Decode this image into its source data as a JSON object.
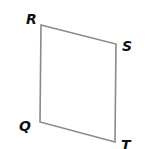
{
  "figure": {
    "shape": "parallelogram",
    "stroke_color": "#8a8a8a",
    "label_color": "#111111",
    "vertices": [
      {
        "label": "R",
        "x": 41,
        "y": 25,
        "label_x": 26,
        "label_y": 24
      },
      {
        "label": "S",
        "x": 116,
        "y": 44,
        "label_x": 122,
        "label_y": 51
      },
      {
        "label": "T",
        "x": 115,
        "y": 142,
        "label_x": 121,
        "label_y": 150
      },
      {
        "label": "Q",
        "x": 40,
        "y": 122,
        "label_x": 19,
        "label_y": 131
      }
    ]
  }
}
